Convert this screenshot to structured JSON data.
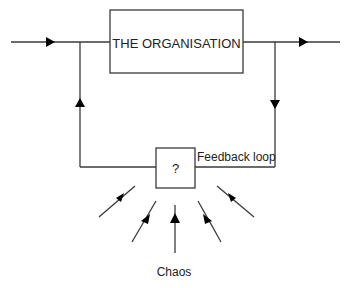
{
  "diagram": {
    "main_box": {
      "label": "THE ORGANISATION"
    },
    "feedback_box": {
      "label": "?"
    },
    "feedback_label": "Feedback loop",
    "chaos_label": "Chaos",
    "flows": [
      {
        "from": "input",
        "to": "THE ORGANISATION",
        "direction": "right"
      },
      {
        "from": "THE ORGANISATION",
        "to": "output",
        "direction": "right"
      },
      {
        "from": "output branch",
        "to": "?",
        "direction": "down"
      },
      {
        "from": "?",
        "to": "input branch",
        "direction": "up"
      },
      {
        "from": "Chaos",
        "to": "?",
        "direction": "inward",
        "count": 5
      }
    ]
  }
}
